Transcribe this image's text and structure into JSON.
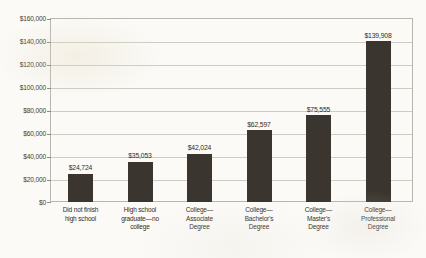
{
  "chart_data": {
    "type": "bar",
    "title": "",
    "subtitle": "",
    "xlabel": "",
    "ylabel": "",
    "ylim": [
      0,
      160000
    ],
    "grid": true,
    "legend": "none",
    "orientation": "vertical",
    "bar_color": "#3a352e",
    "categories": [
      "Did not finish high school",
      "High school graduate—no college",
      "College—Associate Degree",
      "College—Bachelor's Degree",
      "College—Master's Degree",
      "College—Professional Degree"
    ],
    "category_lines": [
      [
        "Did not finish",
        "high school"
      ],
      [
        "High school",
        "graduate—no",
        "college"
      ],
      [
        "College—",
        "Associate",
        "Degree"
      ],
      [
        "College—",
        "Bachelor's",
        "Degree"
      ],
      [
        "College—",
        "Master's",
        "Degree"
      ],
      [
        "College—",
        "Professional",
        "Degree"
      ]
    ],
    "values": [
      24724,
      35053,
      42024,
      62597,
      75555,
      139908
    ],
    "value_labels": [
      "$24,724",
      "$35,053",
      "$42,024",
      "$62,597",
      "$75,555",
      "$139,908"
    ],
    "ytick_values": [
      0,
      20000,
      40000,
      60000,
      80000,
      100000,
      120000,
      140000,
      160000
    ],
    "ytick_labels": [
      "$0",
      "$20,000",
      "$40,000",
      "$60,000",
      "$80,000",
      "$100,000",
      "$120,000",
      "$140,000",
      "$160,000"
    ]
  }
}
